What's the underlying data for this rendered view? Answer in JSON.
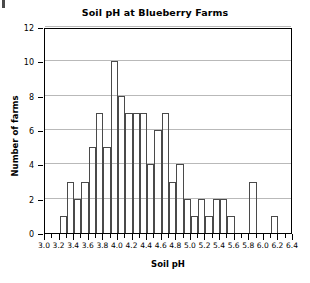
{
  "chart_data": {
    "type": "bar",
    "title": "Soil pH at Blueberry Farms",
    "xlabel": "Soil pH",
    "ylabel": "Number of farms",
    "xlim": [
      3.0,
      6.4
    ],
    "ylim": [
      0,
      12
    ],
    "bin_width": 0.1,
    "grid": true,
    "legend": null,
    "x_major_step": 0.2,
    "x_minor_step": 0.1,
    "y_tick_step": 2,
    "x_tick_labels": [
      "3.0",
      "3.2",
      "3.4",
      "3.6",
      "3.8",
      "4.0",
      "4.2",
      "4.4",
      "4.6",
      "4.8",
      "5.0",
      "5.2",
      "5.4",
      "5.6",
      "5.8",
      "6.0",
      "6.2",
      "6.4"
    ],
    "x_tick_values": [
      3.0,
      3.2,
      3.4,
      3.6,
      3.8,
      4.0,
      4.2,
      4.4,
      4.6,
      4.8,
      5.0,
      5.2,
      5.4,
      5.6,
      5.8,
      6.0,
      6.2,
      6.4
    ],
    "y_tick_labels": [
      "0",
      "2",
      "4",
      "6",
      "8",
      "10",
      "12"
    ],
    "y_tick_values": [
      0,
      2,
      4,
      6,
      8,
      10,
      12
    ],
    "gridline_values": [
      2,
      4,
      6,
      8,
      10,
      12
    ],
    "bin_starts": [
      3.0,
      3.1,
      3.2,
      3.3,
      3.4,
      3.5,
      3.6,
      3.7,
      3.8,
      3.9,
      4.0,
      4.1,
      4.2,
      4.3,
      4.4,
      4.5,
      4.6,
      4.7,
      4.8,
      4.9,
      5.0,
      5.1,
      5.2,
      5.3,
      5.4,
      5.5,
      5.6,
      5.7,
      5.8,
      5.9,
      6.0,
      6.1,
      6.2,
      6.3
    ],
    "categories": [
      "3.0-3.1",
      "3.1-3.2",
      "3.2-3.3",
      "3.3-3.4",
      "3.4-3.5",
      "3.5-3.6",
      "3.6-3.7",
      "3.7-3.8",
      "3.8-3.9",
      "3.9-4.0",
      "4.0-4.1",
      "4.1-4.2",
      "4.2-4.3",
      "4.3-4.4",
      "4.4-4.5",
      "4.5-4.6",
      "4.6-4.7",
      "4.7-4.8",
      "4.8-4.9",
      "4.9-5.0",
      "5.0-5.1",
      "5.1-5.2",
      "5.2-5.3",
      "5.3-5.4",
      "5.4-5.5",
      "5.5-5.6",
      "5.6-5.7",
      "5.7-5.8",
      "5.8-5.9",
      "5.9-6.0",
      "6.0-6.1",
      "6.1-6.2",
      "6.2-6.3",
      "6.3-6.4"
    ],
    "values": [
      0,
      0,
      1,
      3,
      2,
      3,
      5,
      7,
      5,
      10,
      8,
      7,
      7,
      7,
      4,
      6,
      7,
      3,
      4,
      2,
      1,
      2,
      1,
      2,
      2,
      1,
      0,
      0,
      3,
      0,
      0,
      1,
      0,
      0
    ],
    "total_farms": 100
  },
  "colors": {
    "bar_outline": "#4a4a4a",
    "axis": "#000000",
    "gridline": "#b9b9b9",
    "background": "#ffffff",
    "text": "#000000"
  }
}
